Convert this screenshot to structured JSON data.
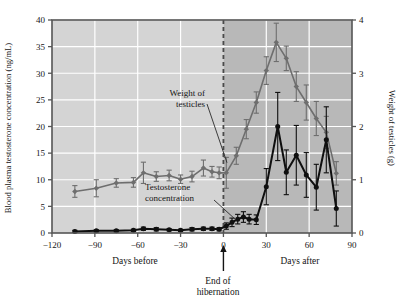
{
  "chart_data": {
    "type": "line",
    "title": "",
    "subtitle": "",
    "xlabel": "",
    "ylabel": "Blood plasma testosterone concentration (ng/mL)",
    "y2label": "Weight of testicles (g)",
    "xlim": [
      -120,
      90
    ],
    "ylim": [
      0,
      40
    ],
    "y2lim": [
      0,
      4
    ],
    "xticks": [
      -120,
      -90,
      -60,
      -30,
      0,
      30,
      60,
      90
    ],
    "xticklabels": [
      "−120",
      "−90",
      "−60",
      "−30",
      "0",
      "30",
      "60",
      "90"
    ],
    "yticks": [
      0,
      5,
      10,
      15,
      20,
      25,
      30,
      35,
      40
    ],
    "yticklabels": [
      "0",
      "5",
      "10",
      "15",
      "20",
      "25",
      "30",
      "35",
      "40"
    ],
    "y2ticks": [
      0,
      1,
      2,
      3,
      4
    ],
    "y2ticklabels": [
      "0",
      "1",
      "2",
      "3",
      "4"
    ],
    "grid": true,
    "grid_color": "#ffffff",
    "plot_bg_before": "#d4d4d4",
    "plot_bg_after": "#b8b8b8",
    "frame_color": "#555555",
    "legend_position": "inline-annotations",
    "annotations": [
      {
        "name": "weight-of-testicles-label",
        "text_line1": "Weight of",
        "text_line2": "testicles",
        "points_to_x": 2,
        "points_to_y": 13.5,
        "color": "#6b6b6b"
      },
      {
        "name": "testosterone-concentration-label",
        "text_line1": "Testosterone",
        "text_line2": "concentration",
        "points_to_x": 9,
        "points_to_y": 2.2,
        "color": "#111111"
      },
      {
        "name": "end-of-hibernation-marker",
        "text_line1": "End of",
        "text_line2": "hibernation",
        "at_x": 0,
        "style": "dashed vertical line with upward arrow"
      },
      {
        "name": "days-before-label",
        "text": "Days before"
      },
      {
        "name": "days-after-label",
        "text": "Days after"
      }
    ],
    "series": [
      {
        "name": "Weight of testicles",
        "axis": "right",
        "unit": "g",
        "color": "#6e6e6e",
        "marker": "diamond",
        "x": [
          -104,
          -89,
          -75,
          -63,
          -56,
          -47,
          -38,
          -30,
          -22,
          -14,
          -8,
          -3,
          2,
          9,
          16,
          23,
          30,
          37,
          44,
          51,
          58,
          65,
          72,
          79
        ],
        "y_left": [
          7.8,
          8.4,
          9.4,
          9.5,
          11.3,
          10.6,
          10.8,
          10.1,
          10.6,
          12.2,
          11.5,
          11.3,
          11.3,
          14.5,
          19.5,
          24.5,
          30.5,
          35.8,
          32.8,
          27.5,
          24.5,
          21.5,
          18.9,
          11.2
        ],
        "y_right": [
          0.78,
          0.84,
          0.94,
          0.95,
          1.13,
          1.06,
          1.08,
          1.01,
          1.06,
          1.22,
          1.15,
          1.13,
          1.13,
          1.45,
          1.95,
          2.45,
          3.05,
          3.58,
          3.28,
          2.75,
          2.45,
          2.15,
          1.89,
          1.12
        ],
        "yerr_left": [
          1.1,
          1.6,
          0.8,
          0.9,
          2.0,
          0.9,
          1.0,
          0.8,
          1.0,
          1.5,
          1.0,
          1.1,
          2.9,
          1.6,
          1.8,
          2.0,
          2.6,
          3.6,
          2.3,
          2.8,
          3.3,
          3.2,
          3.0,
          2.2
        ]
      },
      {
        "name": "Testosterone concentration",
        "axis": "left",
        "unit": "ng/mL",
        "color": "#0f0f0f",
        "marker": "circle",
        "x": [
          -104,
          -89,
          -75,
          -63,
          -56,
          -47,
          -38,
          -30,
          -22,
          -14,
          -8,
          -3,
          2,
          6,
          10,
          14,
          18,
          23,
          30,
          38,
          44,
          51,
          58,
          65,
          72,
          79
        ],
        "y_left": [
          0.3,
          0.4,
          0.4,
          0.5,
          0.8,
          0.7,
          0.6,
          0.5,
          0.7,
          0.8,
          0.8,
          0.7,
          1.3,
          2.0,
          2.6,
          3.0,
          2.6,
          2.5,
          8.7,
          20.0,
          11.4,
          14.6,
          10.9,
          8.6,
          17.5,
          4.6
        ],
        "yerr_left": [
          0.2,
          0.2,
          0.2,
          0.2,
          0.3,
          0.3,
          0.2,
          0.2,
          0.3,
          0.3,
          0.3,
          0.3,
          0.6,
          0.8,
          0.9,
          1.0,
          0.9,
          0.9,
          3.4,
          6.4,
          4.2,
          5.6,
          4.2,
          4.3,
          6.2,
          3.3
        ]
      }
    ]
  },
  "axes": {
    "left_title": "Blood plasma testosterone concentration (ng/mL)",
    "right_title": "Weight of testicles (g)"
  },
  "labels": {
    "days_before": "Days before",
    "days_after": "Days after",
    "end_of_hibernation_line1": "End of",
    "end_of_hibernation_line2": "hibernation",
    "weight_line1": "Weight of",
    "weight_line2": "testicles",
    "testosterone_line1": "Testosterone",
    "testosterone_line2": "concentration"
  }
}
